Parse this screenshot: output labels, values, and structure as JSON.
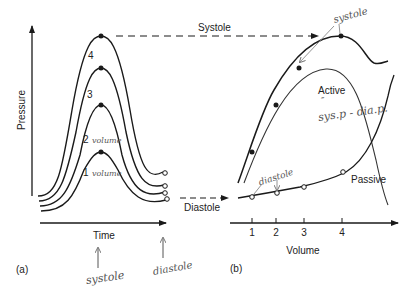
{
  "panel_a": {
    "label": "(a)",
    "y_axis_label": "Pressure",
    "x_axis_label": "Time",
    "curve_labels": [
      "1",
      "2",
      "3",
      "4"
    ],
    "handwritten_volume_1": "volume",
    "handwritten_volume_2": "volume",
    "handwritten_systole": "systole",
    "handwritten_diastole": "diastole"
  },
  "arrows": {
    "systole_label": "Systole",
    "diastole_label": "Diastole"
  },
  "panel_b": {
    "label": "(b)",
    "x_axis_label": "Volume",
    "x_ticks": [
      "1",
      "2",
      "3",
      "4"
    ],
    "active_label": "Active",
    "passive_label": "Passive",
    "handwritten_systole": "systole",
    "handwritten_diastole": "diastole",
    "handwritten_active_note_mark": "″",
    "handwritten_active_note": "sys.p - dia.p."
  },
  "colors": {
    "ink": "#1a1a1a",
    "handwriting": "#666666"
  }
}
